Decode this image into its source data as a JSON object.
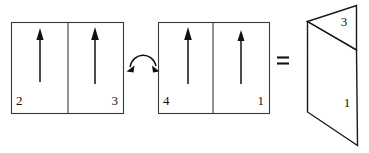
{
  "figure": {
    "type": "physics-domain-diagram",
    "background_color": "#ffffff",
    "line_color": "#1a1a1a",
    "text_color": "#111111"
  },
  "left_group": {
    "name": "left-domain-pair",
    "panels": [
      {
        "label": "2",
        "label_align": "left",
        "arrow": "up-arrow"
      },
      {
        "label": "3",
        "label_align": "right",
        "arrow": "up-arrow"
      }
    ]
  },
  "transform": {
    "name": "curved-double-arrow",
    "symbol": "↔",
    "description": "curved double-headed arrow"
  },
  "right_group": {
    "name": "right-domain-pair",
    "panels": [
      {
        "label": "4",
        "label_align": "left",
        "arrow": "up-arrow"
      },
      {
        "label": "1",
        "label_align": "right",
        "arrow": "up-arrow"
      }
    ]
  },
  "equals": {
    "name": "equals-sign",
    "symbol": "="
  },
  "folded_sheet": {
    "name": "folded-sheet",
    "labels": [
      {
        "text": "3",
        "position": "upper-face"
      },
      {
        "text": "1",
        "position": "lower-face"
      }
    ]
  }
}
